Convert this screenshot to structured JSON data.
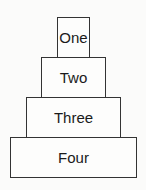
{
  "diagram": {
    "type": "stacked-pyramid",
    "levels": [
      {
        "label": "One"
      },
      {
        "label": "Two"
      },
      {
        "label": "Three"
      },
      {
        "label": "Four"
      }
    ],
    "colors": {
      "border": "#333333",
      "fill": "#fdfdfc",
      "text": "#1a1a1a"
    }
  }
}
